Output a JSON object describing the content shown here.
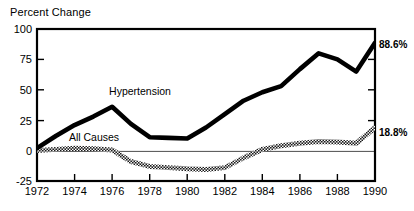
{
  "chart_data": {
    "type": "line",
    "title": "Percent Change",
    "xlabel": "",
    "ylabel": "Percent Change",
    "xlim": [
      1972,
      1990
    ],
    "ylim": [
      -25,
      100
    ],
    "yticks": [
      "100",
      "75",
      "50",
      "25",
      "0",
      "-25"
    ],
    "ytick_values": [
      100,
      75,
      50,
      25,
      0,
      -25
    ],
    "xticks": [
      "1972",
      "1974",
      "1976",
      "1978",
      "1980",
      "1982",
      "1984",
      "1986",
      "1988",
      "1990"
    ],
    "xtick_values": [
      1972,
      1974,
      1976,
      1978,
      1980,
      1982,
      1984,
      1986,
      1988,
      1990
    ],
    "grid": false,
    "zero_line": true,
    "legend_position": "inline-annotation",
    "series": [
      {
        "name": "Hypertension",
        "label": "Hypertension",
        "style": "solid-thick-black",
        "color": "#000000",
        "end_label": "88.6%",
        "x": [
          1972,
          1973,
          1974,
          1975,
          1976,
          1977,
          1978,
          1979,
          1980,
          1981,
          1982,
          1983,
          1984,
          1985,
          1986,
          1987,
          1988,
          1989,
          1990
        ],
        "values": [
          2,
          12,
          21,
          28,
          36,
          22,
          11,
          10.5,
          10,
          19,
          30,
          41,
          48,
          53,
          67,
          80,
          75,
          65,
          88.6
        ]
      },
      {
        "name": "All Causes",
        "label": "All Causes",
        "style": "hatched-band",
        "color": "#3a3a3a",
        "end_label": "18.8%",
        "x": [
          1972,
          1973,
          1974,
          1975,
          1976,
          1977,
          1978,
          1979,
          1980,
          1981,
          1982,
          1983,
          1984,
          1985,
          1986,
          1987,
          1988,
          1989,
          1990
        ],
        "values": [
          0,
          1,
          2,
          1.5,
          0.5,
          -9,
          -13,
          -14,
          -15,
          -15.5,
          -14,
          -6,
          1,
          4,
          6,
          7.5,
          7,
          6,
          18.8
        ]
      }
    ],
    "annotations": [
      {
        "text": "Hypertension",
        "x": 1976.6,
        "y": 45
      },
      {
        "text": "All Causes",
        "x": 1974.5,
        "y": 8
      },
      {
        "text": "88.6%",
        "x": 1990.3,
        "y": 86
      },
      {
        "text": "18.8%",
        "x": 1990.3,
        "y": 19
      }
    ]
  }
}
